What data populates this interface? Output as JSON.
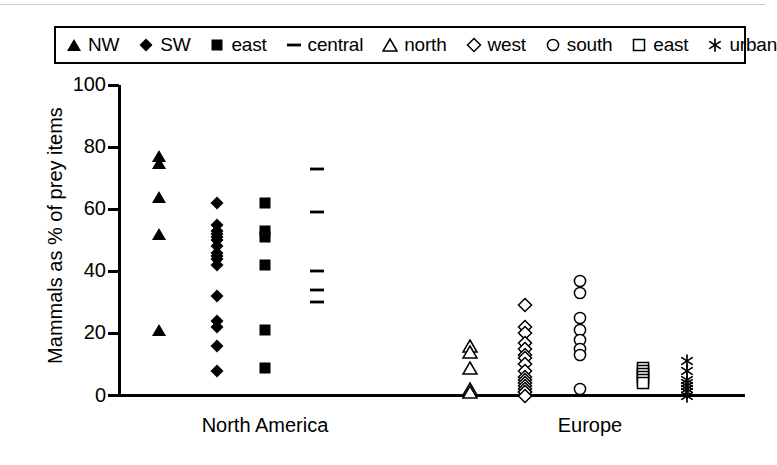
{
  "chart_data": {
    "type": "scatter",
    "title": "",
    "xlabel": "",
    "ylabel": "Mammals as % of prey items",
    "ylim": [
      0,
      100
    ],
    "yticks": [
      0,
      20,
      40,
      60,
      80,
      100
    ],
    "ytick_labels": [
      "0",
      "20",
      "40",
      "60",
      "80",
      "100"
    ],
    "grid": false,
    "legend_position": "top",
    "group_labels": [
      "North America",
      "Europe"
    ],
    "series": [
      {
        "name": "NW",
        "marker": "filled-triangle",
        "region": "North America",
        "x": 1,
        "values": [
          77,
          75,
          64,
          52,
          21
        ]
      },
      {
        "name": "SW",
        "marker": "filled-diamond",
        "region": "North America",
        "x": 2,
        "values": [
          62,
          55,
          53,
          52,
          51,
          50,
          48,
          46,
          45,
          44,
          42,
          32,
          24,
          22,
          16,
          8
        ]
      },
      {
        "name": "east",
        "marker": "filled-square",
        "region": "North America",
        "x": 3,
        "values": [
          62,
          53,
          51,
          42,
          21,
          9
        ]
      },
      {
        "name": "central",
        "marker": "dash",
        "region": "North America",
        "x": 4,
        "values": [
          73,
          59,
          40,
          34,
          30
        ]
      },
      {
        "name": "north",
        "marker": "open-triangle",
        "region": "Europe",
        "x": 6,
        "values": [
          16,
          14,
          9,
          2,
          1
        ]
      },
      {
        "name": "west",
        "marker": "open-diamond",
        "region": "Europe",
        "x": 7,
        "values": [
          29,
          22,
          20,
          17,
          15,
          13,
          12,
          10,
          8,
          6,
          5,
          4,
          3,
          2,
          1,
          1,
          0
        ]
      },
      {
        "name": "south",
        "marker": "open-circle",
        "region": "Europe",
        "x": 8,
        "values": [
          37,
          33,
          25,
          21,
          18,
          15,
          13,
          2
        ]
      },
      {
        "name": "east",
        "marker": "open-square",
        "region": "Europe",
        "x": 9,
        "values": [
          9,
          8,
          7,
          6,
          5,
          4
        ]
      },
      {
        "name": "urban",
        "marker": "asterisk",
        "region": "Europe",
        "x": 10,
        "values": [
          11,
          8,
          5,
          4,
          3,
          2,
          1,
          0
        ]
      }
    ]
  },
  "legend": {
    "entries": [
      {
        "label": "NW",
        "marker": "filled-triangle"
      },
      {
        "label": "SW",
        "marker": "filled-diamond"
      },
      {
        "label": "east",
        "marker": "filled-square"
      },
      {
        "label": "central",
        "marker": "dash"
      },
      {
        "label": "north",
        "marker": "open-triangle"
      },
      {
        "label": "west",
        "marker": "open-diamond"
      },
      {
        "label": "south",
        "marker": "open-circle"
      },
      {
        "label": "east",
        "marker": "open-square"
      },
      {
        "label": "urban",
        "marker": "asterisk"
      }
    ]
  },
  "colors": {
    "marker": "#000000",
    "axis": "#000000",
    "background": "#ffffff",
    "top_rule": "#c9c9c9"
  }
}
